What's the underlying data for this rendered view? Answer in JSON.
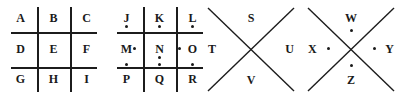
{
  "diagram": {
    "stroke_color": "#1c1c1c",
    "text_color": "#1a1a1a",
    "background_color": "#ffffff",
    "figures": [
      {
        "id": "grid-plain",
        "type": "grid",
        "dots": false,
        "cells": [
          {
            "letter": "A",
            "row": 0,
            "col": 0,
            "dot": "none"
          },
          {
            "letter": "B",
            "row": 0,
            "col": 1,
            "dot": "none"
          },
          {
            "letter": "C",
            "row": 0,
            "col": 2,
            "dot": "none"
          },
          {
            "letter": "D",
            "row": 1,
            "col": 0,
            "dot": "none"
          },
          {
            "letter": "E",
            "row": 1,
            "col": 1,
            "dot": "none"
          },
          {
            "letter": "F",
            "row": 1,
            "col": 2,
            "dot": "none"
          },
          {
            "letter": "G",
            "row": 2,
            "col": 0,
            "dot": "none"
          },
          {
            "letter": "H",
            "row": 2,
            "col": 1,
            "dot": "none"
          },
          {
            "letter": "I",
            "row": 2,
            "col": 2,
            "dot": "none"
          }
        ]
      },
      {
        "id": "grid-dotted",
        "type": "grid",
        "dots": true,
        "cells": [
          {
            "letter": "J",
            "row": 0,
            "col": 0,
            "dot": "below"
          },
          {
            "letter": "K",
            "row": 0,
            "col": 1,
            "dot": "below"
          },
          {
            "letter": "L",
            "row": 0,
            "col": 2,
            "dot": "below"
          },
          {
            "letter": "M",
            "row": 1,
            "col": 0,
            "dot": "right"
          },
          {
            "letter": "N",
            "row": 1,
            "col": 1,
            "dot": "below"
          },
          {
            "letter": "O",
            "row": 1,
            "col": 2,
            "dot": "left"
          },
          {
            "letter": "P",
            "row": 2,
            "col": 0,
            "dot": "above"
          },
          {
            "letter": "Q",
            "row": 2,
            "col": 1,
            "dot": "above"
          },
          {
            "letter": "R",
            "row": 2,
            "col": 2,
            "dot": "above"
          }
        ]
      },
      {
        "id": "x-plain",
        "type": "x",
        "dots": false,
        "quadrants": [
          {
            "letter": "S",
            "position": "top"
          },
          {
            "letter": "T",
            "position": "left"
          },
          {
            "letter": "U",
            "position": "right"
          },
          {
            "letter": "V",
            "position": "bottom"
          }
        ]
      },
      {
        "id": "x-dotted",
        "type": "x",
        "dots": true,
        "quadrants": [
          {
            "letter": "W",
            "position": "top"
          },
          {
            "letter": "X",
            "position": "left"
          },
          {
            "letter": "Y",
            "position": "right"
          },
          {
            "letter": "Z",
            "position": "bottom"
          }
        ]
      }
    ]
  }
}
